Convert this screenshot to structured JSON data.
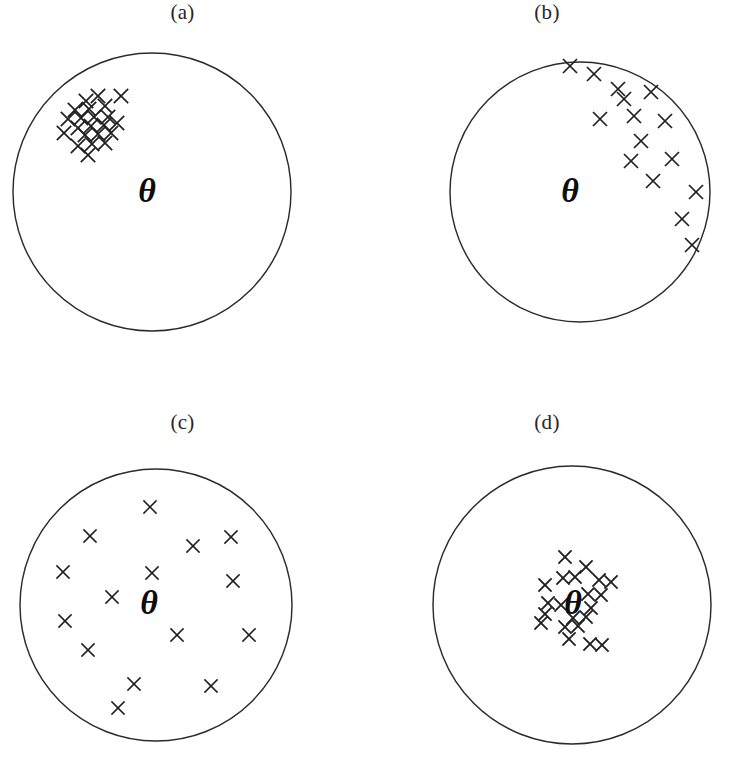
{
  "figure": {
    "background_color": "#ffffff",
    "ink_color": "#202020",
    "circle_stroke_color": "#2b2b2b",
    "width": 729,
    "height": 764
  },
  "chart_data": {
    "type": "scatter",
    "xlabel": "",
    "ylabel": "",
    "grid": false,
    "legend": null,
    "axis_ranges": {
      "x": [
        -1,
        1
      ],
      "y": [
        -1,
        1
      ]
    },
    "note": "Each panel is a unit circle (target) with a bold italic theta marking the true parameter value; x marks are repeated estimates.",
    "panels": [
      {
        "label": "(a)",
        "interpretation": "high bias, low variance",
        "circle": {
          "cx": 152,
          "cy": 192,
          "r": 139
        },
        "theta": {
          "symbol": "θ",
          "x": 147,
          "y": 190,
          "font_size": 34
        },
        "n_points": 22,
        "points": [
          [
            86,
            101
          ],
          [
            98,
            96
          ],
          [
            121,
            96
          ],
          [
            75,
            110
          ],
          [
            89,
            109
          ],
          [
            105,
            106
          ],
          [
            68,
            119
          ],
          [
            81,
            118
          ],
          [
            94,
            117
          ],
          [
            108,
            117
          ],
          [
            78,
            128
          ],
          [
            91,
            126
          ],
          [
            104,
            125
          ],
          [
            117,
            123
          ],
          [
            64,
            133
          ],
          [
            85,
            135
          ],
          [
            98,
            134
          ],
          [
            111,
            133
          ],
          [
            78,
            146
          ],
          [
            92,
            144
          ],
          [
            105,
            143
          ],
          [
            88,
            155
          ]
        ]
      },
      {
        "label": "(b)",
        "interpretation": "high bias, high variance",
        "circle": {
          "cx": 580,
          "cy": 192,
          "r": 130
        },
        "theta": {
          "symbol": "θ",
          "x": 570,
          "y": 190,
          "font_size": 34
        },
        "n_points": 17,
        "points": [
          [
            570,
            66
          ],
          [
            594,
            74
          ],
          [
            618,
            89
          ],
          [
            624,
            99
          ],
          [
            651,
            92
          ],
          [
            600,
            119
          ],
          [
            634,
            116
          ],
          [
            665,
            121
          ],
          [
            641,
            141
          ],
          [
            631,
            161
          ],
          [
            672,
            159
          ],
          [
            653,
            181
          ],
          [
            696,
            192
          ],
          [
            682,
            219
          ],
          [
            692,
            245
          ]
        ]
      },
      {
        "label": "(c)",
        "interpretation": "low bias, high variance",
        "circle": {
          "cx": 156,
          "cy": 605,
          "r": 136
        },
        "theta": {
          "symbol": "θ",
          "x": 149,
          "y": 602,
          "font_size": 34
        },
        "n_points": 15,
        "points": [
          [
            150,
            507
          ],
          [
            90,
            536
          ],
          [
            193,
            546
          ],
          [
            231,
            537
          ],
          [
            63,
            572
          ],
          [
            152,
            573
          ],
          [
            233,
            581
          ],
          [
            112,
            597
          ],
          [
            65,
            621
          ],
          [
            177,
            635
          ],
          [
            249,
            635
          ],
          [
            88,
            650
          ],
          [
            134,
            684
          ],
          [
            211,
            686
          ],
          [
            118,
            708
          ]
        ]
      },
      {
        "label": "(d)",
        "interpretation": "low bias, low variance",
        "circle": {
          "cx": 572,
          "cy": 605,
          "r": 139
        },
        "theta": {
          "symbol": "θ",
          "x": 573,
          "y": 602,
          "font_size": 34
        },
        "n_points": 21,
        "points": [
          [
            565,
            557
          ],
          [
            586,
            567
          ],
          [
            563,
            578
          ],
          [
            575,
            577
          ],
          [
            599,
            580
          ],
          [
            611,
            582
          ],
          [
            545,
            585
          ],
          [
            588,
            594
          ],
          [
            601,
            595
          ],
          [
            548,
            603
          ],
          [
            561,
            605
          ],
          [
            591,
            608
          ],
          [
            545,
            614
          ],
          [
            573,
            618
          ],
          [
            586,
            617
          ],
          [
            541,
            623
          ],
          [
            565,
            627
          ],
          [
            578,
            626
          ],
          [
            569,
            639
          ],
          [
            590,
            644
          ],
          [
            602,
            645
          ]
        ]
      }
    ]
  },
  "panels": {
    "a": {
      "label": "(a)",
      "theta": "θ"
    },
    "b": {
      "label": "(b)",
      "theta": "θ"
    },
    "c": {
      "label": "(c)",
      "theta": "θ"
    },
    "d": {
      "label": "(d)",
      "theta": "θ"
    }
  }
}
